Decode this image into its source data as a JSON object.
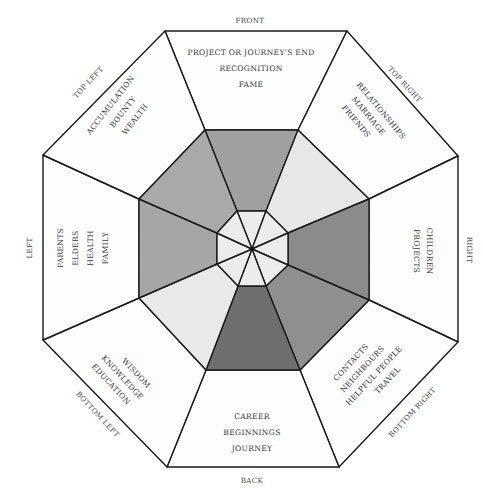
{
  "diagram": {
    "type": "bagua-octagon",
    "center": [
      252,
      249
    ],
    "colors": {
      "outline": "#1a1a1a",
      "outer_fill": "#fdfdfd",
      "inner_fill": "#ececec",
      "text": "#3a3a3a"
    },
    "sectors": [
      {
        "id": "front",
        "direction": "FRONT",
        "lines": [
          "PROJECT OR JOURNEY'S END",
          "RECOGNITION",
          "FAME"
        ],
        "middle_fill": "#a0a0a0"
      },
      {
        "id": "top-right",
        "direction": "TOP RIGHT",
        "lines": [
          "RELATIONSHIPS",
          "MARRIAGE",
          "FRIENDS"
        ],
        "middle_fill": "#e7e7e7"
      },
      {
        "id": "right",
        "direction": "RIGHT",
        "lines": [
          "CHILDREN",
          "PROJECTS"
        ],
        "middle_fill": "#8b8b8b"
      },
      {
        "id": "bottom-right",
        "direction": "BOTTOM RIGHT",
        "lines": [
          "CONTACTS",
          "NEIGHBOURS",
          "HELPFUL PEOPLE",
          "TRAVEL"
        ],
        "middle_fill": "#8f8f8f"
      },
      {
        "id": "back",
        "direction": "BACK",
        "lines": [
          "CAREER",
          "BEGINNINGS",
          "JOURNEY"
        ],
        "middle_fill": "#6f6f6f"
      },
      {
        "id": "bottom-left",
        "direction": "BOTTOM LEFT",
        "lines": [
          "WISDOM",
          "KNOWLEDGE",
          "EDUCATION"
        ],
        "middle_fill": "#e9e9e9"
      },
      {
        "id": "left",
        "direction": "LEFT",
        "lines": [
          "PARENTS",
          "ELDERS",
          "HEALTH",
          "FAMILY"
        ],
        "middle_fill": "#a6a6a6"
      },
      {
        "id": "top-left",
        "direction": "TOP LEFT",
        "lines": [
          "ACCUMULATION",
          "BOUNTY",
          "WEALTH"
        ],
        "middle_fill": "#a9a9a9"
      }
    ]
  }
}
